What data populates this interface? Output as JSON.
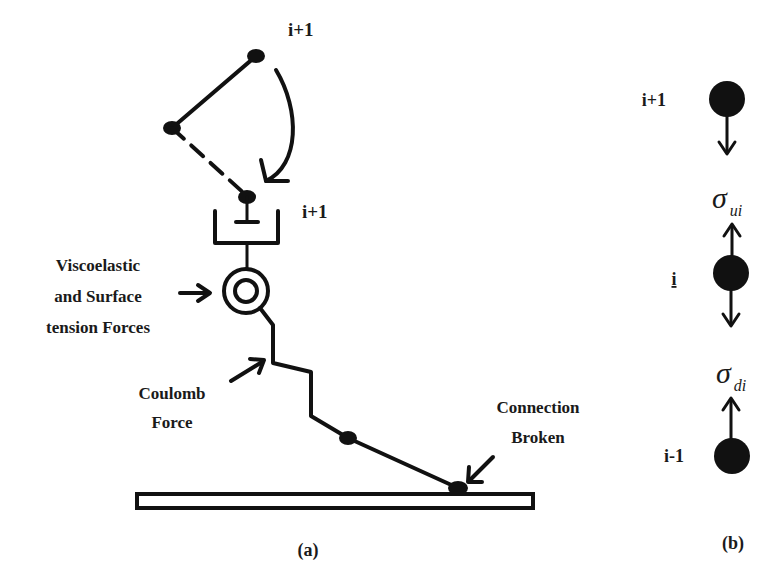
{
  "panel_a": {
    "caption": "(a)",
    "labels": {
      "top_bead": "i+1",
      "middle_bead": "i+1",
      "viscoelastic_line1": "Viscoelastic",
      "viscoelastic_line2": "and Surface",
      "viscoelastic_line3": "tension Forces",
      "coulomb_line1": "Coulomb",
      "coulomb_line2": "Force",
      "connection_line1": "Connection",
      "connection_line2": "Broken"
    }
  },
  "panel_b": {
    "caption": "(b)",
    "beads": [
      {
        "label": "i+1"
      },
      {
        "label": "i"
      },
      {
        "label": "i-1"
      }
    ],
    "stresses": {
      "upper_symbol": "σ",
      "upper_subscript": "ui",
      "lower_symbol": "σ",
      "lower_subscript": "di"
    }
  },
  "colors": {
    "ink": "#111111",
    "background": "#ffffff"
  }
}
